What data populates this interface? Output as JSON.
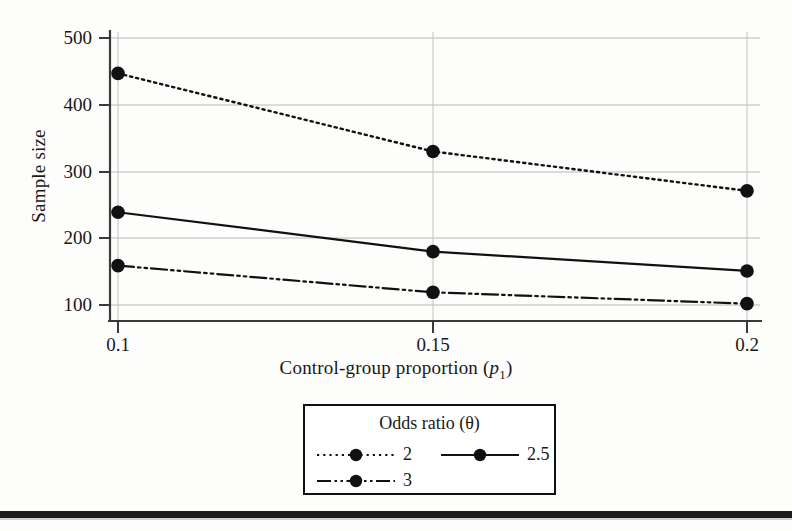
{
  "chart_data": {
    "type": "line",
    "title": "",
    "xlabel": "Control-group proportion (p₁)",
    "xlabel_parts": {
      "pre": "Control-group proportion (",
      "var": "p",
      "sub": "1",
      "post": ")"
    },
    "ylabel": "Sample size",
    "x": [
      0.1,
      0.15,
      0.2
    ],
    "xtick_labels": [
      "0.1",
      "0.15",
      "0.2"
    ],
    "ytick_labels": [
      "100",
      "200",
      "300",
      "400",
      "500"
    ],
    "yticks": [
      100,
      200,
      300,
      400,
      500
    ],
    "ylim": [
      80,
      520
    ],
    "xlim": [
      0.09,
      0.207
    ],
    "grid": "horizontal-and-vertical",
    "legend_position": "below-axes-center",
    "legend_title": "Odds ratio (θ)",
    "series": [
      {
        "name": "2",
        "label": "2",
        "values": [
          447,
          330,
          271
        ],
        "linestyle": "dotted",
        "marker": "circle",
        "color": "#111111"
      },
      {
        "name": "2.5",
        "label": "2.5",
        "values": [
          239,
          180,
          151
        ],
        "linestyle": "solid",
        "marker": "circle",
        "color": "#111111"
      },
      {
        "name": "3",
        "label": "3",
        "values": [
          159,
          119,
          102
        ],
        "linestyle": "dash-dot-dot",
        "marker": "circle",
        "color": "#111111"
      }
    ]
  },
  "figure": {
    "axis_color": "#3a3a3a",
    "grid_color": "#b8b8b8",
    "text_color": "#181818",
    "background": "#fdfdfc",
    "bottom_rule_color": "#1b1b1b"
  }
}
